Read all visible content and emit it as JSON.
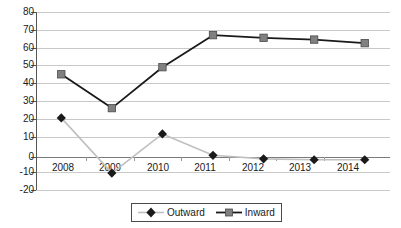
{
  "chart_data": {
    "type": "line",
    "title": "",
    "xlabel": "",
    "ylabel": "",
    "categories": [
      "2008",
      "2009",
      "2010",
      "2011",
      "2012",
      "2013",
      "2014"
    ],
    "series": [
      {
        "name": "Outward",
        "marker": "diamond",
        "marker_color": "#1a1a1a",
        "line_color": "#c0c0c0",
        "values": [
          20.5,
          -10.5,
          11.5,
          -0.5,
          -2.5,
          -3,
          -3
        ]
      },
      {
        "name": "Inward",
        "marker": "square",
        "marker_color": "#808080",
        "line_color": "#1a1a1a",
        "values": [
          45,
          26,
          49,
          67,
          65.5,
          64.5,
          62.5
        ]
      }
    ],
    "ylim": [
      -20,
      80
    ],
    "ytick_step": 10,
    "yticks": [
      "80",
      "70",
      "60",
      "50",
      "40",
      "30",
      "20",
      "10",
      "0",
      "-10",
      "-20"
    ],
    "grid": true,
    "legend_position": "bottom",
    "legend_entries": [
      "Outward",
      "Inward"
    ]
  },
  "legend": {
    "outward_label": "Outward",
    "inward_label": "Inward"
  }
}
